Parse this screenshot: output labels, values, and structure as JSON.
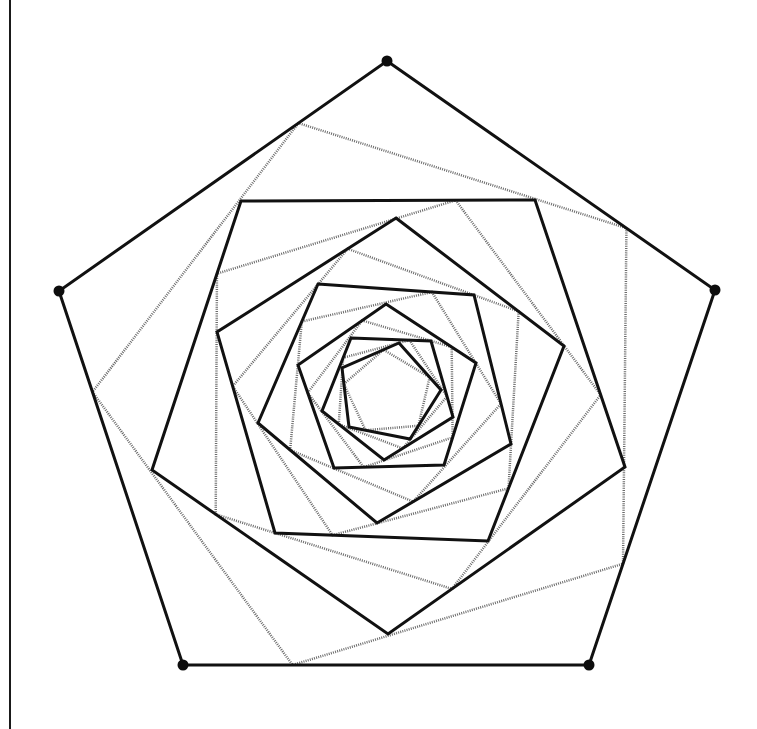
{
  "diagram": {
    "colors": {
      "solid_stroke": "#111111",
      "dotted_stroke": "#6a6a6a",
      "background": "#ffffff",
      "vertex_dot": "#0d0d0d"
    },
    "edge_fraction": 0.73,
    "solid_pentagons": [
      [
        [
          387,
          61
        ],
        [
          715,
          290
        ],
        [
          589,
          665
        ],
        [
          183,
          665
        ],
        [
          59,
          291
        ]
      ],
      [
        [
          241,
          201
        ],
        [
          535,
          200
        ],
        [
          625,
          467
        ],
        [
          388,
          634
        ],
        [
          152,
          470
        ]
      ],
      [
        [
          396,
          218
        ],
        [
          564,
          346
        ],
        [
          488,
          541
        ],
        [
          275,
          533
        ],
        [
          217,
          332
        ]
      ],
      [
        [
          318,
          284
        ],
        [
          474,
          295
        ],
        [
          511,
          444
        ],
        [
          377,
          523
        ],
        [
          258,
          423
        ]
      ],
      [
        [
          386,
          304
        ],
        [
          476,
          363
        ],
        [
          444,
          465
        ],
        [
          334,
          468
        ],
        [
          298,
          365
        ]
      ],
      [
        [
          351,
          338
        ],
        [
          431,
          341
        ],
        [
          453,
          417
        ],
        [
          384,
          460
        ],
        [
          322,
          411
        ]
      ],
      [
        [
          399,
          343
        ],
        [
          441,
          390
        ],
        [
          410,
          439
        ],
        [
          349,
          427
        ],
        [
          342,
          368
        ]
      ]
    ],
    "outer_vertex_dots": [
      [
        387,
        61
      ],
      [
        715,
        290
      ],
      [
        589,
        665
      ],
      [
        183,
        665
      ],
      [
        59,
        291
      ]
    ]
  }
}
